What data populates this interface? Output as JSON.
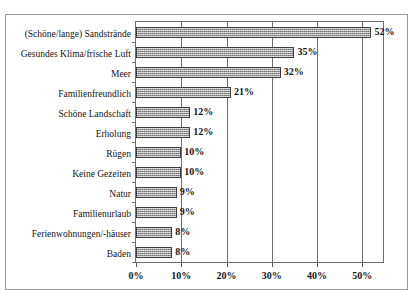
{
  "chart_data": {
    "type": "bar",
    "orientation": "horizontal",
    "title": "",
    "xlabel": "",
    "ylabel": "",
    "xlim": [
      0,
      55
    ],
    "grid": true,
    "legend": null,
    "xticks": [
      "0%",
      "10%",
      "20%",
      "30%",
      "40%",
      "50%"
    ],
    "xtick_values": [
      0,
      10,
      20,
      30,
      40,
      50
    ],
    "categories": [
      "(Schöne/lange) Sandstrände",
      "Gesundes Klima/frische Luft",
      "Meer",
      "Familienfreundlich",
      "Schöne Landschaft",
      "Erholung",
      "Rügen",
      "Keine Gezeiten",
      "Natur",
      "Familienurlaub",
      "Ferienwohnungen/-häuser",
      "Baden"
    ],
    "values": [
      52,
      35,
      32,
      21,
      12,
      12,
      10,
      10,
      9,
      9,
      8,
      8
    ],
    "data_labels": [
      "52%",
      "35%",
      "32%",
      "21%",
      "12%",
      "12%",
      "10%",
      "10%",
      "9%",
      "9%",
      "8%",
      "8%"
    ],
    "colors": {
      "bar_fill": "#a9a9a9",
      "bar_edge": "#3d3d3d",
      "grid": "#6e6e6e",
      "frame": "#9a9a9a",
      "text": "#141414"
    }
  }
}
